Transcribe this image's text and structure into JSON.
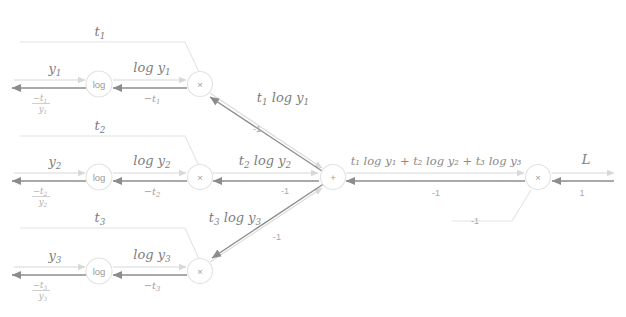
{
  "diagram": {
    "colors": {
      "forward_arrow": "#d8d8d8",
      "backward_arrow": "#8c8c8c",
      "node_stroke": "#e2e2e2",
      "node_label": "#9a9a9a",
      "forward_text": "#7d7d7d",
      "backward_text": "#9e9e9e",
      "background": "#ffffff"
    },
    "nodes": {
      "log1": "log",
      "log2": "log",
      "log3": "log",
      "mul1": "×",
      "mul2": "×",
      "mul3": "×",
      "sum": "+",
      "mul_final": "×"
    },
    "rows": [
      {
        "input_forward": "y",
        "input_forward_sub": "1",
        "input_backward_num": "−t",
        "input_backward_num_sub": "1",
        "input_backward_den": "y",
        "input_backward_den_sub": "1",
        "t_label": "t",
        "t_label_sub": "1",
        "log_forward": "log y",
        "log_forward_sub": "1",
        "log_backward": "−t",
        "log_backward_sub": "1",
        "prod_forward": "t",
        "prod_forward_sub": "1",
        "prod_forward_rest": "log y",
        "prod_forward_rest_sub": "1",
        "prod_backward": "-1"
      },
      {
        "input_forward": "y",
        "input_forward_sub": "2",
        "input_backward_num": "−t",
        "input_backward_num_sub": "2",
        "input_backward_den": "y",
        "input_backward_den_sub": "2",
        "t_label": "t",
        "t_label_sub": "2",
        "log_forward": "log y",
        "log_forward_sub": "2",
        "log_backward": "−t",
        "log_backward_sub": "2",
        "prod_forward": "t",
        "prod_forward_sub": "2",
        "prod_forward_rest": "log y",
        "prod_forward_rest_sub": "2",
        "prod_backward": "-1"
      },
      {
        "input_forward": "y",
        "input_forward_sub": "3",
        "input_backward_num": "−t",
        "input_backward_num_sub": "3",
        "input_backward_den": "y",
        "input_backward_den_sub": "3",
        "t_label": "t",
        "t_label_sub": "3",
        "log_forward": "log y",
        "log_forward_sub": "3",
        "log_backward": "−t",
        "log_backward_sub": "3",
        "prod_forward": "t",
        "prod_forward_sub": "3",
        "prod_forward_rest": "log y",
        "prod_forward_rest_sub": "3",
        "prod_backward": "-1"
      }
    ],
    "sum_edge": {
      "forward": "t₁ log y₁ + t₂ log y₂ + t₃ log y₃",
      "backward": "-1"
    },
    "constant_input": {
      "value": "-1"
    },
    "output_edge": {
      "forward": "L",
      "backward": "1"
    }
  }
}
